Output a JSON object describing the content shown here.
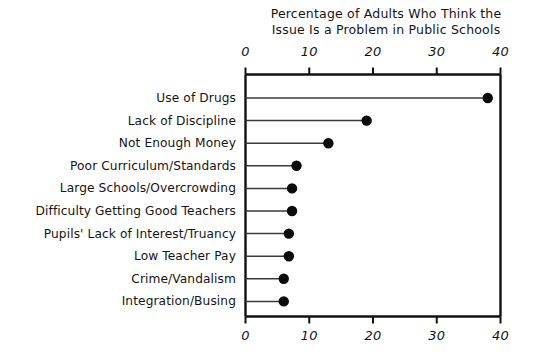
{
  "chart_data": {
    "type": "bar",
    "orientation": "horizontal",
    "style": "lollipop",
    "title": "Percentage of Adults Who Think the Issue Is a Problem in Public Schools",
    "title_lines": [
      "Percentage of Adults Who Think the",
      "Issue Is a Problem in Public Schools"
    ],
    "xlabel": "",
    "ylabel": "",
    "xlim": [
      0,
      40
    ],
    "xticks": [
      0,
      10,
      20,
      30,
      40
    ],
    "xtick_labels": [
      "0",
      "10",
      "20",
      "30",
      "40"
    ],
    "grid": false,
    "legend": false,
    "axis_top": true,
    "axis_bottom": true,
    "categories": [
      "Use of Drugs",
      "Lack of Discipline",
      "Not Enough Money",
      "Poor Curriculum/Standards",
      "Large Schools/Overcrowding",
      "Difficulty Getting Good Teachers",
      "Pupils' Lack of Interest/Truancy",
      "Low Teacher Pay",
      "Crime/Vandalism",
      "Integration/Busing"
    ],
    "values": [
      38,
      19,
      13,
      8,
      7.3,
      7.3,
      6.8,
      6.8,
      6,
      6
    ],
    "colors": {
      "dot": "#0b0b0b",
      "stem": "#3a3a3a",
      "axis": "#111111",
      "text": "#141414",
      "background": "#ffffff"
    }
  }
}
